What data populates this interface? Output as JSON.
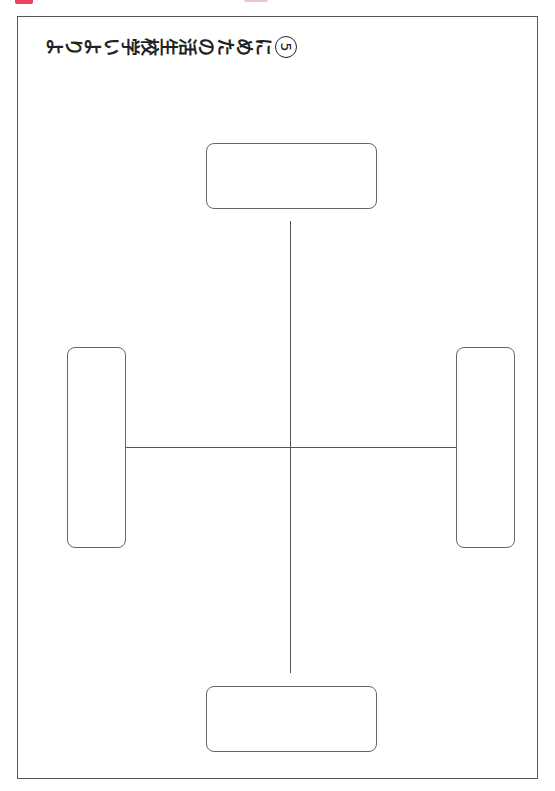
{
  "header": {
    "title_chars": [
      "よ",
      "り",
      "よ",
      "い",
      "学",
      "校",
      "生",
      "活",
      "の",
      "た",
      "め",
      "に"
    ],
    "title_number": "5",
    "title_full": "よりよい学校生活のために⑤"
  },
  "colors": {
    "accent_tab": "#e8425f",
    "border": "#555555"
  },
  "diagram": {
    "boxes": [
      {
        "position": "top",
        "text": ""
      },
      {
        "position": "left",
        "text": ""
      },
      {
        "position": "right",
        "text": ""
      },
      {
        "position": "bottom",
        "text": ""
      }
    ]
  }
}
